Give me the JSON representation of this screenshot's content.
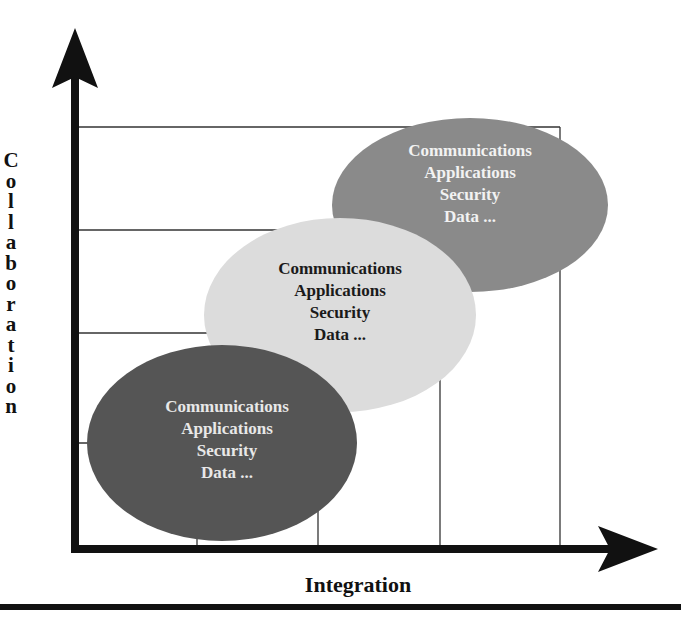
{
  "diagram": {
    "axes": {
      "y_label": "Collaboration",
      "y_label_letters": [
        "C",
        "o",
        "l",
        "l",
        "a",
        "b",
        "o",
        "r",
        "a",
        "t",
        "i",
        "o",
        "n"
      ],
      "x_label": "Integration"
    },
    "bubbles": [
      {
        "position": "bottom-left",
        "fill": "#555555",
        "text_color": "#e8e8e8",
        "lines": [
          "Communications",
          "Applications",
          "Security",
          "Data ..."
        ]
      },
      {
        "position": "middle",
        "fill": "#dcdcdc",
        "text_color": "#1a1a1a",
        "lines": [
          "Communications",
          "Applications",
          "Security",
          "Data ..."
        ]
      },
      {
        "position": "top-right",
        "fill": "#8a8a8a",
        "text_color": "#f2f2f2",
        "lines": [
          "Communications",
          "Applications",
          "Security",
          "Data ..."
        ]
      }
    ],
    "colors": {
      "axis": "#111111",
      "grid": "#333333",
      "background": "#ffffff"
    }
  }
}
